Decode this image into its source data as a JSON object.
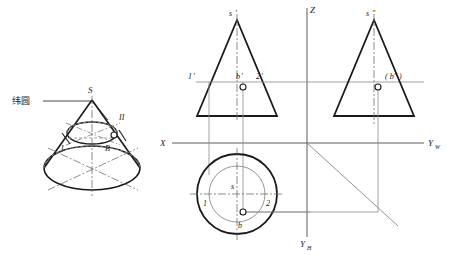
{
  "figure": {
    "title_hidden": "",
    "colors": {
      "outline": "#1a1a1a",
      "thin": "#8a8a8a",
      "center": "#7a7a7a",
      "marker_fill": "#ffffff"
    }
  },
  "pictorial": {
    "name": "cone-pictorial-view",
    "labels": {
      "apex": "S",
      "point_one": "I",
      "point_two": "II",
      "point_b": "B",
      "leader_text": "纬圆"
    }
  },
  "projection": {
    "axes": {
      "z": "Z",
      "x": "X",
      "yw": "Y",
      "yw_sub": "W",
      "yh": "Y",
      "yh_sub": "H"
    },
    "front_view": {
      "name": "front-view",
      "labels": {
        "apex": "s",
        "apex_prime": "′",
        "p1": "1",
        "p1_prime": "′",
        "pb": "b",
        "pb_prime": "′",
        "p2": "2",
        "p2_prime": "′"
      }
    },
    "side_view": {
      "name": "side-view",
      "labels": {
        "apex": "s",
        "apex_dprime": "″",
        "pb": "( b″ )"
      }
    },
    "top_view": {
      "name": "top-view",
      "labels": {
        "apex": "s",
        "p1": "1",
        "p2": "2",
        "pb": "b"
      }
    }
  }
}
